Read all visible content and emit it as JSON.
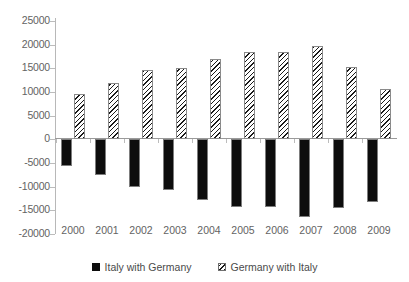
{
  "chart_data": {
    "type": "bar",
    "title": "",
    "xlabel": "",
    "ylabel": "",
    "categories": [
      "2000",
      "2001",
      "2002",
      "2003",
      "2004",
      "2005",
      "2006",
      "2007",
      "2008",
      "2009"
    ],
    "series": [
      {
        "name": "Italy with Germany",
        "pattern": "solid-black",
        "values": [
          -5600,
          -7500,
          -10100,
          -10700,
          -12900,
          -14200,
          -14400,
          -16500,
          -14600,
          -13300
        ]
      },
      {
        "name": "Germany with Italy",
        "pattern": "diagonal-hatch",
        "values": [
          9600,
          12000,
          14600,
          15000,
          16900,
          18400,
          18400,
          19700,
          15200,
          10700
        ]
      }
    ],
    "ylim": [
      -20000,
      25000
    ],
    "yticks": [
      25000,
      20000,
      15000,
      10000,
      5000,
      0,
      -5000,
      -10000,
      -15000,
      -20000
    ],
    "ytick_labels": [
      "25000",
      "20000",
      "15000",
      "10000",
      "5000",
      "0",
      "-5000",
      "-10000",
      "-15000",
      "-20000"
    ],
    "grid": false,
    "legend_position": "bottom",
    "legend": [
      "Italy with Germany",
      "Germany with Italy"
    ]
  },
  "legend": {
    "series_solid_label": "Italy with Germany",
    "series_hatch_label": "Germany with Italy"
  }
}
